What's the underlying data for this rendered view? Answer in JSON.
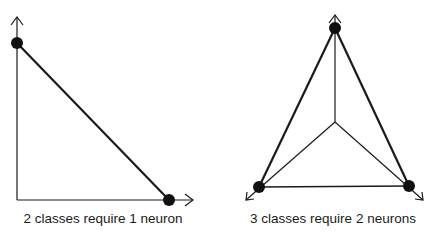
{
  "diagrams": [
    {
      "id": "two-class",
      "caption": "2 classes require 1 neuron",
      "axes": {
        "origin": [
          17,
          200
        ],
        "y_axis_end": [
          17,
          17
        ],
        "x_axis_end": [
          193,
          200
        ]
      },
      "points": [
        [
          17,
          43
        ],
        [
          169,
          200
        ]
      ],
      "edges": [
        [
          [
            17,
            43
          ],
          [
            169,
            200
          ]
        ]
      ]
    },
    {
      "id": "three-class",
      "caption": "3 classes require 2 neurons",
      "center": [
        335,
        122
      ],
      "points": [
        [
          335,
          28
        ],
        [
          259,
          187
        ],
        [
          409,
          186
        ]
      ],
      "axis_ends": [
        [
          335,
          15
        ],
        [
          246,
          200
        ],
        [
          423,
          200
        ]
      ]
    }
  ],
  "colors": {
    "line": "#1a1a1a",
    "dot": "#111111",
    "background": "#ffffff"
  }
}
